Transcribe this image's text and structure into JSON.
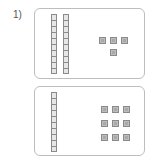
{
  "question": {
    "number_label": "1)"
  },
  "cards": [
    {
      "id": "top",
      "tens": 2,
      "ones": 4,
      "value": 24
    },
    {
      "id": "bottom",
      "tens": 1,
      "ones": 9,
      "value": 19
    }
  ],
  "colors": {
    "border": "#bdbdbd",
    "block_fill": "#bdbdbd",
    "block_outline": "#8a8a8a",
    "text": "#555555"
  }
}
